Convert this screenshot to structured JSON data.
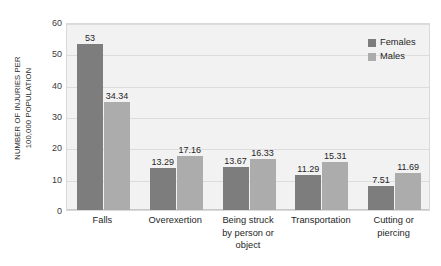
{
  "chart_data": {
    "type": "bar",
    "title": "",
    "subtitle": "",
    "xlabel": "",
    "ylabel": "NUMBER OF INJURIES PER 100,000 POPULATION",
    "ylabel_lines": [
      "NUMBER OF INJURIES PER",
      "100,000 POPULATION"
    ],
    "categories": [
      "Falls",
      "Overexertion",
      "Being struck by person or object",
      "Transportation",
      "Cutting or piercing"
    ],
    "category_lines": [
      [
        "Falls"
      ],
      [
        "Overexertion"
      ],
      [
        "Being struck",
        "by person or",
        "object"
      ],
      [
        "Transportation"
      ],
      [
        "Cutting or",
        "piercing"
      ]
    ],
    "series": [
      {
        "name": "Females",
        "color": "#7d7d7d",
        "values": [
          53,
          13.29,
          13.67,
          11.29,
          7.51
        ],
        "value_labels": [
          "53",
          "13.29",
          "13.67",
          "11.29",
          "7.51"
        ]
      },
      {
        "name": "Males",
        "color": "#acacac",
        "values": [
          34.34,
          17.16,
          16.33,
          15.31,
          11.69
        ],
        "value_labels": [
          "34.34",
          "17.16",
          "16.33",
          "15.31",
          "11.69"
        ]
      }
    ],
    "ylim": [
      0,
      60
    ],
    "yticks": [
      0,
      10,
      20,
      30,
      40,
      50,
      60
    ],
    "ytick_labels": [
      "0",
      "10",
      "20",
      "30",
      "40",
      "50",
      "60"
    ],
    "grid": true,
    "legend_position": "top-right",
    "plot_background": "#f2f2f2",
    "gridline_color": "#dcdcdc",
    "data_labels": true
  }
}
